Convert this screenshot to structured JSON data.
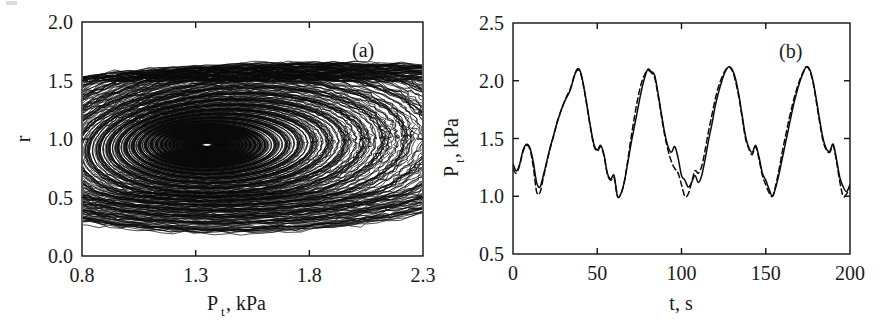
{
  "figure": {
    "background": "#ffffff",
    "ink": "#0a0a0a",
    "panels": [
      {
        "id": "panel-a",
        "label": "(a)",
        "type": "scatter",
        "plot_box": {
          "x": 82,
          "y": 22,
          "w": 341,
          "h": 234
        },
        "xlabel_main": "P",
        "xlabel_sub": "t",
        "xlabel_tail": ", kPa",
        "ylabel": "r",
        "xticks": [
          "0.8",
          "1.3",
          "1.8",
          "2.3"
        ],
        "yticks": [
          "0.0",
          "0.5",
          "1.0",
          "1.5",
          "2.0"
        ],
        "xlim": [
          0.8,
          2.3
        ],
        "ylim": [
          0.0,
          2.0
        ]
      },
      {
        "id": "panel-b",
        "label": "(b)",
        "type": "line",
        "plot_box": {
          "x": 513,
          "y": 23,
          "w": 337,
          "h": 231
        },
        "xlabel_main": "t, s",
        "ylabel_main": "P",
        "ylabel_sub": "t",
        "ylabel_tail": ", kPa",
        "xticks": [
          "0",
          "50",
          "100",
          "150",
          "200"
        ],
        "yticks": [
          "0.5",
          "1.0",
          "1.5",
          "2.0",
          "2.5"
        ],
        "xlim": [
          0,
          200
        ],
        "ylim": [
          0.5,
          2.5
        ]
      }
    ]
  },
  "chart_data": [
    {
      "type": "scatter",
      "title": "(a)",
      "xlabel": "P_t, kPa",
      "ylabel": "r",
      "xlim": [
        0.8,
        2.3
      ],
      "ylim": [
        0.0,
        2.0
      ],
      "xticks": [
        0.8,
        1.3,
        1.8,
        2.3
      ],
      "yticks": [
        0.0,
        0.5,
        1.0,
        1.5,
        2.0
      ],
      "grid": false,
      "legend": "none",
      "description": "Chaotic strange attractor (phase portrait) of r versus P_t. Trajectory spirals outward from a focus near (1.35, 0.95), expanding into broad loops that reach P_t near 2.1 at the right, with a dense upper band near r = 1.5 and a lower return band near r = 0.45 to 0.6.",
      "attractor": {
        "focus": [
          1.35,
          0.95
        ],
        "r_band_upper": 1.55,
        "r_band_lower": 0.45,
        "p_min": 0.93,
        "p_max": 2.12,
        "n_loops": 46,
        "spiral_growth": 1.105,
        "stretch_x": 0.47,
        "stretch_y": 0.33
      }
    },
    {
      "type": "line",
      "title": "(b)",
      "xlabel": "t, s",
      "ylabel": "P_t, kPa",
      "xlim": [
        0,
        200
      ],
      "ylim": [
        0.5,
        2.5
      ],
      "xticks": [
        0,
        50,
        100,
        150,
        200
      ],
      "yticks": [
        0.5,
        1.0,
        1.5,
        2.0,
        2.5
      ],
      "grid": false,
      "legend": "none",
      "series": [
        {
          "name": "solid",
          "style": "solid",
          "x": [
            0,
            2,
            4,
            6,
            8,
            10,
            12,
            14,
            16,
            18,
            20,
            22,
            24,
            26,
            28,
            30,
            32,
            34,
            36,
            38,
            40,
            42,
            44,
            46,
            48,
            50,
            52,
            54,
            56,
            58,
            60,
            62,
            64,
            66,
            68,
            70,
            72,
            74,
            76,
            78,
            80,
            82,
            84,
            86,
            88,
            90,
            92,
            94,
            96,
            98,
            100,
            102,
            104,
            106,
            108,
            110,
            112,
            114,
            116,
            118,
            120,
            122,
            124,
            126,
            128,
            130,
            132,
            134,
            136,
            138,
            140,
            142,
            144,
            146,
            148,
            150,
            152,
            154,
            156,
            158,
            160,
            162,
            164,
            166,
            168,
            170,
            172,
            174,
            176,
            178,
            180,
            182,
            184,
            186,
            188,
            190,
            192,
            194,
            196,
            198,
            200
          ],
          "y": [
            1.28,
            1.22,
            1.28,
            1.4,
            1.45,
            1.42,
            1.3,
            1.12,
            1.08,
            1.18,
            1.3,
            1.42,
            1.52,
            1.63,
            1.72,
            1.8,
            1.86,
            1.92,
            2.02,
            2.1,
            2.08,
            1.95,
            1.78,
            1.6,
            1.45,
            1.4,
            1.44,
            1.36,
            1.2,
            1.15,
            1.18,
            1.0,
            1.02,
            1.12,
            1.28,
            1.45,
            1.6,
            1.75,
            1.9,
            2.02,
            2.1,
            2.08,
            2.05,
            1.9,
            1.72,
            1.55,
            1.43,
            1.38,
            1.43,
            1.33,
            1.18,
            1.14,
            1.08,
            1.12,
            1.18,
            1.12,
            1.18,
            1.32,
            1.48,
            1.62,
            1.78,
            1.9,
            2.0,
            2.08,
            2.12,
            2.1,
            2.02,
            1.88,
            1.7,
            1.52,
            1.42,
            1.38,
            1.44,
            1.34,
            1.2,
            1.14,
            1.06,
            1.0,
            1.08,
            1.2,
            1.34,
            1.48,
            1.62,
            1.76,
            1.88,
            1.98,
            2.06,
            2.12,
            2.1,
            2.0,
            1.84,
            1.66,
            1.5,
            1.41,
            1.39,
            1.45,
            1.32,
            1.16,
            1.08,
            1.04,
            1.1
          ]
        },
        {
          "name": "dashed",
          "style": "dashed",
          "x": [
            0,
            2,
            4,
            6,
            8,
            10,
            12,
            14,
            16,
            18,
            20,
            22,
            24,
            26,
            28,
            30,
            32,
            34,
            36,
            38,
            40,
            42,
            44,
            46,
            48,
            50,
            52,
            54,
            56,
            58,
            60,
            62,
            64,
            66,
            68,
            70,
            72,
            74,
            76,
            78,
            80,
            82,
            84,
            86,
            88,
            90,
            92,
            94,
            96,
            98,
            100,
            102,
            104,
            106,
            108,
            110,
            112,
            114,
            116,
            118,
            120,
            122,
            124,
            126,
            128,
            130,
            132,
            134,
            136,
            138,
            140,
            142,
            144,
            146,
            148,
            150,
            152,
            154,
            156,
            158,
            160,
            162,
            164,
            166,
            168,
            170,
            172,
            174,
            176,
            178,
            180,
            182,
            184,
            186,
            188,
            190,
            192,
            194,
            196,
            198,
            200
          ],
          "y": [
            1.24,
            1.2,
            1.27,
            1.39,
            1.44,
            1.41,
            1.26,
            1.04,
            1.03,
            1.16,
            1.29,
            1.41,
            1.52,
            1.63,
            1.72,
            1.8,
            1.87,
            1.93,
            2.03,
            2.09,
            2.07,
            1.94,
            1.77,
            1.59,
            1.44,
            1.39,
            1.43,
            1.35,
            1.19,
            1.14,
            1.16,
            1.0,
            1.02,
            1.12,
            1.3,
            1.5,
            1.68,
            1.84,
            1.97,
            2.05,
            2.09,
            2.07,
            2.03,
            1.88,
            1.7,
            1.53,
            1.4,
            1.3,
            1.24,
            1.2,
            1.1,
            1.0,
            1.02,
            1.12,
            1.22,
            1.2,
            1.26,
            1.4,
            1.56,
            1.7,
            1.84,
            1.95,
            2.03,
            2.09,
            2.12,
            2.09,
            2.0,
            1.86,
            1.68,
            1.5,
            1.41,
            1.36,
            1.43,
            1.32,
            1.18,
            1.1,
            1.03,
            1.0,
            1.1,
            1.24,
            1.4,
            1.54,
            1.68,
            1.8,
            1.91,
            2.0,
            2.07,
            2.12,
            2.09,
            1.99,
            1.82,
            1.64,
            1.48,
            1.4,
            1.38,
            1.44,
            1.3,
            1.12,
            1.0,
            1.02,
            1.09
          ]
        }
      ]
    }
  ]
}
